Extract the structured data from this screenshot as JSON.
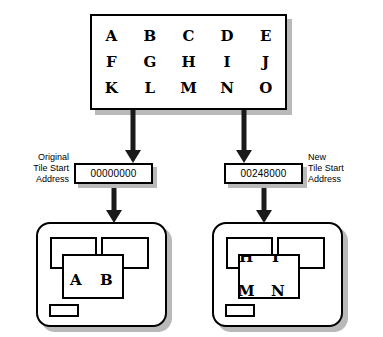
{
  "diagram": {
    "colors": {
      "line": "#000000",
      "arrow": "#1a1a1a",
      "shadow": "#b9b9b9",
      "background": "#ffffff"
    }
  },
  "memory_grid": {
    "rows": [
      [
        "A",
        "B",
        "C",
        "D",
        "E"
      ],
      [
        "F",
        "G",
        "H",
        "I",
        "J"
      ],
      [
        "K",
        "L",
        "M",
        "N",
        "O"
      ]
    ]
  },
  "addresses": {
    "original": {
      "label_lines": [
        "Original",
        "Tile Start",
        "Address"
      ],
      "value": "00000000"
    },
    "new": {
      "label_lines": [
        "New",
        "Tile Start",
        "Address"
      ],
      "value": "00248000"
    }
  },
  "panels": {
    "original": {
      "visible_letters": [
        "A",
        "B"
      ]
    },
    "new": {
      "visible_letters": [
        "H",
        "I",
        "M",
        "N"
      ]
    }
  }
}
